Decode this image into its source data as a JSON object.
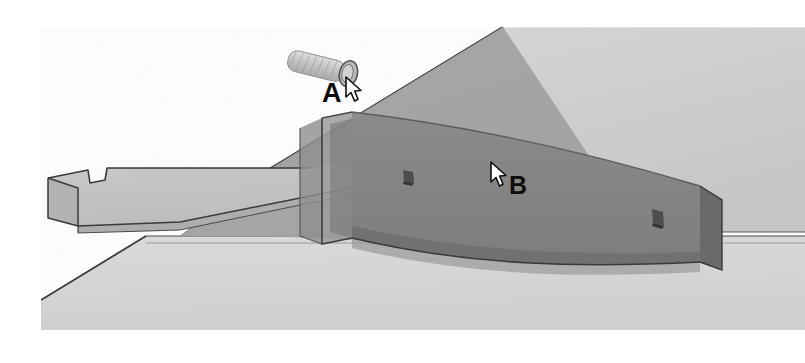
{
  "scene": {
    "type": "3d-assembly-render",
    "title": "Sheet metal bracket assembly",
    "background_color": "#ffffff",
    "colors": {
      "plane_light": "#cdcdcd",
      "plane_light_alt": "#d2d2d2",
      "floor": "#d6d6d6",
      "wedge_mid": "#a6a6a6",
      "panel_dark": "#848484",
      "panel_dark_shade": "#6f6f6f",
      "panel_inner": "#9a9a9a",
      "bracket_face": "#c6c6c6",
      "bracket_side": "#b0b0b0",
      "bracket_edge": "#8f8f8f",
      "outline": "#3a3a3a",
      "hole": "#4a4a4a",
      "screw_body": "#c9c9c9",
      "screw_head": "#b4b4b4",
      "label_text": "#0d0d0d",
      "cursor_fill": "#ffffff",
      "cursor_stroke": "#111111"
    }
  },
  "callouts": [
    {
      "id": "a",
      "label": "A",
      "target": "screw-fastener",
      "description": "Threaded screw with rounded head, held above the bracket slot"
    },
    {
      "id": "b",
      "label": "B",
      "target": "dark-channel-panel",
      "description": "Dark gray vertical channel panel with two mounting holes"
    }
  ],
  "parts": [
    {
      "name": "screw-fastener",
      "label": "A"
    },
    {
      "name": "dark-channel-panel",
      "label": "B"
    },
    {
      "name": "notched-bracket",
      "label": ""
    },
    {
      "name": "base-plate",
      "label": ""
    },
    {
      "name": "upper-plane",
      "label": ""
    }
  ],
  "cursors": [
    {
      "id": "cursor-a",
      "points_at": "screw-fastener"
    },
    {
      "id": "cursor-b",
      "points_at": "dark-channel-panel"
    }
  ]
}
